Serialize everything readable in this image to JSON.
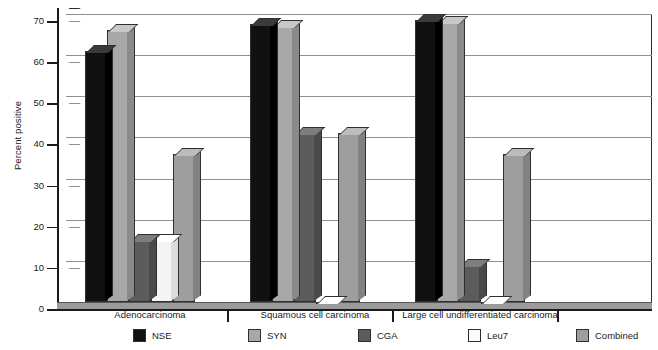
{
  "chart_data": {
    "type": "bar",
    "title": "",
    "xlabel": "",
    "ylabel": "Percent positive",
    "ylim": [
      0,
      70
    ],
    "yticks": [
      0,
      10,
      20,
      30,
      40,
      50,
      60,
      70
    ],
    "ytick_labels": [
      "0",
      "10",
      "20",
      "30",
      "40",
      "50",
      "60",
      "70"
    ],
    "grid": true,
    "legend_position": "bottom",
    "style": "3d-grouped-bar",
    "categories": [
      "Adenocarcinoma",
      "Squamous cell carcinoma",
      "Large cell undifferentiated carcinoma"
    ],
    "series": [
      {
        "name": "NSE",
        "color": "#111111",
        "values": [
          61,
          67.5,
          68.5
        ]
      },
      {
        "name": "SYN",
        "color": "#a8a8a8",
        "values": [
          66,
          67,
          68
        ]
      },
      {
        "name": "CGA",
        "color": "#5c5c5c",
        "values": [
          15,
          41,
          9
        ]
      },
      {
        "name": "Leu7",
        "color": "#f4f4f4",
        "values": [
          15,
          0,
          0
        ]
      },
      {
        "name": "Combined",
        "color": "#9e9e9e",
        "values": [
          36,
          41,
          36
        ]
      }
    ]
  },
  "legend": {
    "items": [
      {
        "label": "NSE"
      },
      {
        "label": "SYN"
      },
      {
        "label": "CGA"
      },
      {
        "label": "Leu7"
      },
      {
        "label": "Combined"
      }
    ]
  }
}
